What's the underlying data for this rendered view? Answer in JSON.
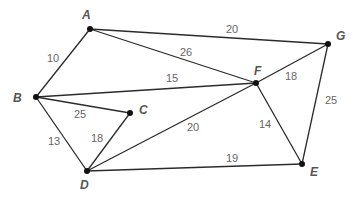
{
  "graph": {
    "type": "weighted-undirected",
    "nodes": [
      {
        "id": "A",
        "x": 90,
        "y": 29,
        "lx": 82,
        "ly": 19
      },
      {
        "id": "B",
        "x": 36,
        "y": 97,
        "lx": 13,
        "ly": 102
      },
      {
        "id": "C",
        "x": 130,
        "y": 113,
        "lx": 139,
        "ly": 114
      },
      {
        "id": "D",
        "x": 87,
        "y": 171,
        "lx": 80,
        "ly": 189
      },
      {
        "id": "E",
        "x": 302,
        "y": 164,
        "lx": 310,
        "ly": 176
      },
      {
        "id": "F",
        "x": 256,
        "y": 83,
        "lx": 254,
        "ly": 75
      },
      {
        "id": "G",
        "x": 328,
        "y": 44,
        "lx": 336,
        "ly": 40
      }
    ],
    "edges": [
      {
        "from": "A",
        "to": "B",
        "weight": "10",
        "lx": 47,
        "ly": 62
      },
      {
        "from": "A",
        "to": "G",
        "weight": "20",
        "lx": 226,
        "ly": 33
      },
      {
        "from": "A",
        "to": "F",
        "weight": "26",
        "lx": 180,
        "ly": 56
      },
      {
        "from": "B",
        "to": "F",
        "weight": "15",
        "lx": 166,
        "ly": 82
      },
      {
        "from": "B",
        "to": "C",
        "weight": "25",
        "lx": 74,
        "ly": 118
      },
      {
        "from": "B",
        "to": "D",
        "weight": "13",
        "lx": 48,
        "ly": 145
      },
      {
        "from": "C",
        "to": "D",
        "weight": "18",
        "lx": 91,
        "ly": 142
      },
      {
        "from": "D",
        "to": "F",
        "weight": "20",
        "lx": 187,
        "ly": 131
      },
      {
        "from": "D",
        "to": "E",
        "weight": "19",
        "lx": 226,
        "ly": 162
      },
      {
        "from": "F",
        "to": "G",
        "weight": "18",
        "lx": 285,
        "ly": 80
      },
      {
        "from": "F",
        "to": "E",
        "weight": "14",
        "lx": 259,
        "ly": 128
      },
      {
        "from": "G",
        "to": "E",
        "weight": "25",
        "lx": 325,
        "ly": 104
      }
    ]
  }
}
